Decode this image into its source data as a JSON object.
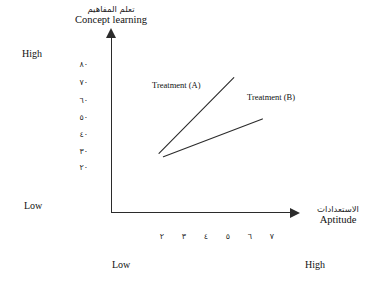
{
  "chart_data": {
    "type": "line",
    "title": "",
    "ylabel_ar": "تعلم المفاهيم",
    "ylabel_en": "Concept learning",
    "xlabel_ar": "الاستعدادات",
    "xlabel_en": "Aptitude",
    "y_anchor_high": "High",
    "y_anchor_low": "Low",
    "x_anchor_low": "Low",
    "x_anchor_high": "High",
    "y_ticks": [
      "٨٠",
      "٧٠",
      "٦٠",
      "٥٠",
      "٤٠",
      "٣٠",
      "٢٠"
    ],
    "y_tick_values": [
      80,
      70,
      60,
      50,
      40,
      30,
      20
    ],
    "x_ticks": [
      "٢",
      "٣",
      "٤",
      "٥",
      "٦",
      "٧"
    ],
    "x_tick_values": [
      2,
      3,
      4,
      5,
      6,
      7
    ],
    "ylim": [
      20,
      80
    ],
    "xlim": [
      2,
      7
    ],
    "grid": false,
    "legend_position": "inline-annotation",
    "series": [
      {
        "name": "Treatment (A)",
        "x": [
          2.0,
          5.4
        ],
        "values": [
          28,
          72
        ],
        "color": "#2b2b2b"
      },
      {
        "name": "Treatment (B)",
        "x": [
          2.2,
          6.7
        ],
        "values": [
          26,
          48
        ],
        "color": "#2b2b2b"
      }
    ],
    "annotations": [
      {
        "text": "Treatment (A)",
        "x": 152,
        "y": 80
      },
      {
        "text": "Treatment (B)",
        "x": 247,
        "y": 92
      }
    ]
  },
  "colors": {
    "axis": "#2b2b2b",
    "line": "#2b2b2b",
    "text": "#111111",
    "background": "#ffffff"
  }
}
